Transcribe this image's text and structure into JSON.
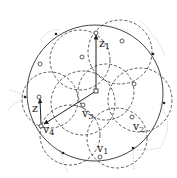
{
  "diagram": {
    "type": "circle-covering",
    "outer_circle": {
      "cx": 95,
      "cy": 93,
      "r": 68,
      "stroke": "#444444"
    },
    "center_point": {
      "x": 96,
      "y": 91
    },
    "dashed_circles": [
      {
        "cx": 80,
        "cy": 60,
        "r": 30
      },
      {
        "cx": 120,
        "cy": 52,
        "r": 32
      },
      {
        "cx": 140,
        "cy": 100,
        "r": 32
      },
      {
        "cx": 117,
        "cy": 138,
        "r": 30
      },
      {
        "cx": 70,
        "cy": 135,
        "r": 30
      },
      {
        "cx": 50,
        "cy": 100,
        "r": 28
      },
      {
        "cx": 83,
        "cy": 103,
        "r": 32
      },
      {
        "cx": 106,
        "cy": 92,
        "r": 28
      }
    ],
    "dotted_arcs": [
      {
        "d": "M40 40 Q 50 28 60 30"
      },
      {
        "d": "M140 20 Q 155 35 165 55"
      },
      {
        "d": "M10 90 Q 20 92 28 98"
      },
      {
        "d": "M160 105 Q 175 125 160 148 Q 150 150 135 150"
      },
      {
        "d": "M60 150 Q 62 162 68 172"
      },
      {
        "d": "M133 148 L 134 170"
      },
      {
        "d": "M8 110 Q 18 100 27 97"
      }
    ],
    "intersection_dots": [
      {
        "x": 56,
        "y": 34
      },
      {
        "x": 153,
        "y": 54
      },
      {
        "x": 25,
        "y": 97
      },
      {
        "x": 164,
        "y": 103
      },
      {
        "x": 63,
        "y": 153
      },
      {
        "x": 133,
        "y": 148
      }
    ],
    "points": [
      {
        "id": "z1",
        "x": 96,
        "y": 33,
        "label": "z",
        "sub": "1",
        "lx": 99,
        "ly": 47
      },
      {
        "id": "z",
        "x": 39,
        "y": 97,
        "label": "z",
        "sub": "",
        "lx": 32,
        "ly": 112
      },
      {
        "id": "v1",
        "x": 100,
        "y": 157,
        "label": "v",
        "sub": "1",
        "lx": 97,
        "ly": 152
      },
      {
        "id": "v2",
        "x": 132,
        "y": 117,
        "label": "v",
        "sub": "2",
        "lx": 133,
        "ly": 130
      },
      {
        "id": "v3",
        "x": 83,
        "y": 105,
        "label": "v",
        "sub": "3",
        "lx": 82,
        "ly": 117
      },
      {
        "id": "v4",
        "x": 41,
        "y": 126,
        "label": "v",
        "sub": "4",
        "lx": 43,
        "ly": 133
      },
      {
        "id": "p1",
        "x": 122,
        "y": 41
      },
      {
        "id": "p2",
        "x": 82,
        "y": 57
      },
      {
        "id": "p3",
        "x": 40,
        "y": 64
      },
      {
        "id": "p4",
        "x": 134,
        "y": 84
      }
    ],
    "arrows": [
      {
        "from": "center",
        "x1": 96,
        "y1": 91,
        "x2": 96,
        "y2": 35,
        "name": "arrow-to-z1"
      },
      {
        "from": "center",
        "x1": 96,
        "y1": 91,
        "x2": 44,
        "y2": 124,
        "name": "arrow-to-v4"
      },
      {
        "from": "v4",
        "x1": 41,
        "y1": 124,
        "x2": 40,
        "y2": 99,
        "name": "arrow-to-z"
      }
    ]
  }
}
